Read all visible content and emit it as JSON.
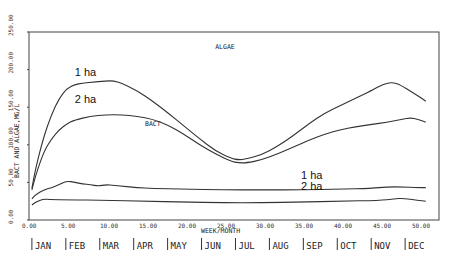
{
  "chart_data": {
    "type": "line",
    "title": "",
    "xlabel": "WEEK/MONTH",
    "ylabel": "BACT AND ALGAE,MG/L",
    "xlim": [
      0,
      53
    ],
    "ylim": [
      0,
      250
    ],
    "x_ticks": [
      "0.00",
      "5.00",
      "10.00",
      "15.00",
      "20.00",
      "25.00",
      "30.00",
      "35.00",
      "40.00",
      "45.00",
      "50.00"
    ],
    "y_ticks": [
      "0.00",
      "50.00",
      "100.00",
      "150.00",
      "200.00",
      "250.00"
    ],
    "months": [
      "JAN",
      "FEB",
      "MAR",
      "APR",
      "MAY",
      "JUN",
      "JUL",
      "AUG",
      "SEP",
      "OCT",
      "NOV",
      "DEC"
    ],
    "grid": false,
    "annotations": [
      {
        "text": "ALGAE",
        "x": 24,
        "y": 228
      },
      {
        "text": "1 ha",
        "x": 6,
        "y": 192
      },
      {
        "text": "2 ha",
        "x": 6,
        "y": 155
      },
      {
        "text": "BACT",
        "x": 15,
        "y": 125
      },
      {
        "text": "1 ha",
        "x": 35,
        "y": 55
      },
      {
        "text": "2 ha",
        "x": 35,
        "y": 40
      }
    ],
    "series": [
      {
        "name": "Algae 1 ha",
        "x": [
          0.5,
          1,
          2,
          3,
          4,
          5,
          6,
          7,
          8,
          10,
          11,
          12,
          14,
          16,
          18,
          20,
          22,
          24,
          26,
          27,
          28,
          30,
          32,
          34,
          36,
          38,
          40,
          42,
          44,
          45,
          46,
          47,
          48,
          50,
          51
        ],
        "values": [
          42,
          70,
          110,
          140,
          162,
          175,
          180,
          182,
          183,
          185,
          185,
          182,
          172,
          158,
          142,
          125,
          108,
          92,
          82,
          80,
          81,
          87,
          98,
          112,
          128,
          142,
          152,
          162,
          172,
          178,
          182,
          183,
          178,
          165,
          158
        ]
      },
      {
        "name": "Algae 2 ha",
        "x": [
          0.5,
          1,
          2,
          3,
          4,
          5,
          6,
          8,
          10,
          12,
          14,
          16,
          18,
          20,
          22,
          24,
          26,
          27,
          28,
          30,
          32,
          34,
          36,
          38,
          40,
          42,
          44,
          46,
          48,
          49,
          50,
          51
        ],
        "values": [
          40,
          60,
          90,
          108,
          120,
          128,
          133,
          138,
          140,
          140,
          138,
          134,
          126,
          114,
          100,
          88,
          78,
          76,
          76,
          80,
          88,
          97,
          106,
          114,
          120,
          124,
          127,
          130,
          134,
          136,
          134,
          130
        ]
      },
      {
        "name": "Bact 1 ha",
        "x": [
          0.5,
          1,
          2,
          3,
          4,
          5,
          6,
          7,
          8,
          9,
          10,
          11,
          12,
          14,
          16,
          20,
          25,
          30,
          35,
          40,
          44,
          46,
          48,
          50,
          51
        ],
        "values": [
          28,
          34,
          40,
          43,
          47,
          52,
          50,
          48,
          47,
          45,
          47,
          46,
          45,
          43,
          42,
          41,
          40,
          40,
          40,
          41,
          42,
          44,
          44,
          43,
          43
        ]
      },
      {
        "name": "Bact 2 ha",
        "x": [
          0.5,
          1,
          2,
          3,
          5,
          10,
          15,
          20,
          25,
          30,
          35,
          40,
          45,
          47,
          48,
          50,
          51
        ],
        "values": [
          20,
          24,
          28,
          27,
          27,
          26,
          25,
          24,
          23,
          23,
          24,
          25,
          26,
          28,
          29,
          26,
          25
        ]
      }
    ]
  }
}
